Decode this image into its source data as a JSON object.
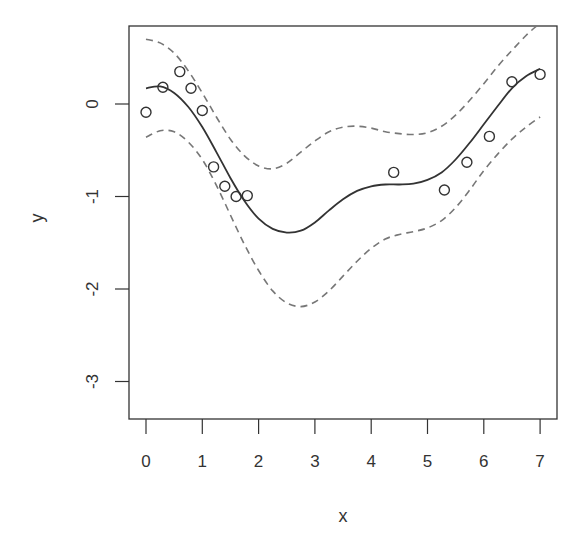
{
  "chart_data": {
    "type": "scatter",
    "title": "",
    "xlabel": "x",
    "ylabel": "y",
    "xlim": [
      -0.3,
      7.3
    ],
    "ylim": [
      -3.4,
      0.85
    ],
    "xticks": [
      0,
      1,
      2,
      3,
      4,
      5,
      6,
      7
    ],
    "yticks": [
      0,
      -1,
      -2,
      -3
    ],
    "grid": false,
    "legend": null,
    "points": {
      "x": [
        0.0,
        0.3,
        0.6,
        0.8,
        1.0,
        1.2,
        1.4,
        1.6,
        1.8,
        4.4,
        5.3,
        5.7,
        6.1,
        6.5,
        7.0
      ],
      "y": [
        -0.09,
        0.18,
        0.35,
        0.17,
        -0.07,
        -0.68,
        -0.89,
        -1.0,
        -0.99,
        -0.74,
        -0.93,
        -0.63,
        -0.35,
        0.24,
        0.32
      ]
    },
    "series": [
      {
        "name": "fit",
        "style": "solid",
        "x": [
          0.0,
          0.25,
          0.5,
          0.75,
          1.0,
          1.25,
          1.5,
          1.75,
          2.0,
          2.25,
          2.5,
          2.75,
          3.0,
          3.25,
          3.5,
          3.75,
          4.0,
          4.25,
          4.5,
          4.75,
          5.0,
          5.25,
          5.5,
          5.75,
          6.0,
          6.25,
          6.5,
          6.75,
          7.0
        ],
        "y": [
          0.17,
          0.19,
          0.12,
          -0.03,
          -0.25,
          -0.52,
          -0.8,
          -1.05,
          -1.24,
          -1.35,
          -1.39,
          -1.37,
          -1.28,
          -1.15,
          -1.03,
          -0.94,
          -0.89,
          -0.87,
          -0.87,
          -0.86,
          -0.82,
          -0.74,
          -0.6,
          -0.42,
          -0.22,
          -0.02,
          0.17,
          0.3,
          0.38
        ]
      },
      {
        "name": "upper band",
        "style": "dashed",
        "x": [
          0.0,
          0.25,
          0.5,
          0.75,
          1.0,
          1.25,
          1.5,
          1.75,
          2.0,
          2.25,
          2.5,
          2.75,
          3.0,
          3.25,
          3.5,
          3.75,
          4.0,
          4.25,
          4.5,
          4.75,
          5.0,
          5.25,
          5.5,
          5.75,
          6.0,
          6.25,
          6.5,
          6.75,
          6.95
        ],
        "y": [
          0.7,
          0.66,
          0.55,
          0.36,
          0.12,
          -0.14,
          -0.38,
          -0.56,
          -0.67,
          -0.7,
          -0.64,
          -0.52,
          -0.4,
          -0.3,
          -0.25,
          -0.24,
          -0.26,
          -0.3,
          -0.32,
          -0.33,
          -0.31,
          -0.24,
          -0.12,
          0.04,
          0.22,
          0.41,
          0.58,
          0.74,
          0.85
        ]
      },
      {
        "name": "lower band",
        "style": "dashed",
        "x": [
          0.0,
          0.25,
          0.5,
          0.75,
          1.0,
          1.25,
          1.5,
          1.75,
          2.0,
          2.25,
          2.5,
          2.75,
          3.0,
          3.25,
          3.5,
          3.75,
          4.0,
          4.25,
          4.5,
          4.75,
          5.0,
          5.25,
          5.5,
          5.75,
          6.0,
          6.25,
          6.5,
          6.75,
          7.0
        ],
        "y": [
          -0.36,
          -0.29,
          -0.3,
          -0.41,
          -0.6,
          -0.88,
          -1.2,
          -1.52,
          -1.8,
          -2.02,
          -2.15,
          -2.19,
          -2.14,
          -2.02,
          -1.86,
          -1.7,
          -1.56,
          -1.46,
          -1.41,
          -1.38,
          -1.34,
          -1.26,
          -1.12,
          -0.93,
          -0.72,
          -0.54,
          -0.38,
          -0.25,
          -0.14
        ]
      }
    ],
    "colors": {
      "points": "#333333",
      "fit": "#333333",
      "band": "#777777",
      "axis": "#333333"
    }
  }
}
